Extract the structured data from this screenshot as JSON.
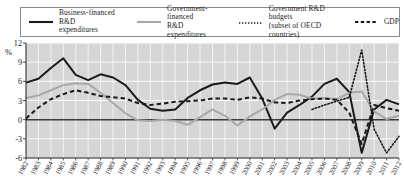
{
  "axis_label": "%",
  "legend": {
    "items": [
      {
        "name": "business-financed",
        "label": "Business-financed R&D\nexpenditures",
        "style": "solid",
        "color": "#1a1a1a",
        "width": 2.1
      },
      {
        "name": "government-financed",
        "label": "Government-financed\nR&D expenditures",
        "style": "solid",
        "color": "#a8a8a8",
        "width": 2.1
      },
      {
        "name": "government-budgets",
        "label": "Government R&D budgets\n(subset of OECD countries)",
        "style": "dotted",
        "color": "#1a1a1a",
        "width": 1.6
      },
      {
        "name": "gdp",
        "label": "GDP",
        "style": "dashed",
        "color": "#1a1a1a",
        "width": 1.8
      }
    ]
  },
  "chart_data": {
    "type": "line",
    "title": "",
    "xlabel": "",
    "ylabel": "%",
    "ylim": [
      -6,
      12
    ],
    "yticks": [
      12,
      9,
      6,
      3,
      0,
      -3,
      -6
    ],
    "grid": true,
    "legend_position": "top",
    "x": [
      1982,
      1983,
      1984,
      1985,
      1986,
      1987,
      1988,
      1989,
      1990,
      1991,
      1992,
      1993,
      1994,
      1995,
      1996,
      1997,
      1998,
      1999,
      2000,
      2001,
      2002,
      2003,
      2004,
      2005,
      2006,
      2007,
      2008,
      2009,
      2010,
      2011,
      2012
    ],
    "categories": [
      "1982",
      "1983",
      "1984",
      "1985",
      "1986",
      "1987",
      "1988",
      "1989",
      "1990",
      "1991",
      "1992",
      "1993",
      "1994",
      "1995",
      "1996",
      "1997",
      "1998",
      "1999",
      "2000",
      "2001",
      "2002",
      "2003",
      "2004",
      "2005",
      "2006",
      "2007",
      "2008",
      "2009",
      "2010",
      "2011",
      "2012"
    ],
    "series": [
      {
        "name": "Business-financed R&D expenditures",
        "color": "#1a1a1a",
        "style": "solid",
        "values": [
          5.8,
          6.4,
          8.1,
          9.6,
          7.0,
          6.2,
          7.1,
          6.6,
          5.4,
          3.1,
          1.7,
          1.4,
          1.6,
          3.4,
          4.6,
          5.5,
          5.8,
          5.6,
          6.6,
          3.3,
          -1.4,
          1.1,
          2.3,
          3.6,
          5.6,
          6.4,
          4.3,
          -5.2,
          1.6,
          3.1,
          2.4
        ]
      },
      {
        "name": "Government-financed R&D expenditures",
        "color": "#a8a8a8",
        "style": "solid",
        "values": [
          3.4,
          3.8,
          4.6,
          5.4,
          5.7,
          5.6,
          4.2,
          2.6,
          1.0,
          -0.1,
          -0.2,
          0.0,
          -0.2,
          -0.8,
          0.4,
          1.6,
          0.6,
          -0.9,
          0.5,
          1.6,
          3.1,
          4.0,
          3.9,
          3.3,
          3.4,
          3.2,
          4.2,
          4.4,
          1.3,
          0.1,
          0.6
        ]
      },
      {
        "name": "Government R&D budgets (subset of OECD countries)",
        "color": "#1a1a1a",
        "style": "dotted",
        "values": [
          null,
          null,
          null,
          null,
          null,
          null,
          null,
          null,
          null,
          null,
          null,
          null,
          null,
          null,
          null,
          null,
          null,
          null,
          null,
          null,
          null,
          null,
          null,
          1.6,
          2.3,
          2.9,
          3.5,
          10.9,
          -1.5,
          -5.2,
          -2.6
        ]
      },
      {
        "name": "GDP",
        "color": "#1a1a1a",
        "style": "dashed",
        "values": [
          0.2,
          1.9,
          3.2,
          4.0,
          4.6,
          4.2,
          3.7,
          3.5,
          3.3,
          2.6,
          2.3,
          2.5,
          2.8,
          2.9,
          3.0,
          3.3,
          3.3,
          3.1,
          3.5,
          3.3,
          2.7,
          2.6,
          3.0,
          3.2,
          3.3,
          3.1,
          1.1,
          -3.8,
          2.3,
          1.8,
          1.4
        ]
      }
    ]
  }
}
